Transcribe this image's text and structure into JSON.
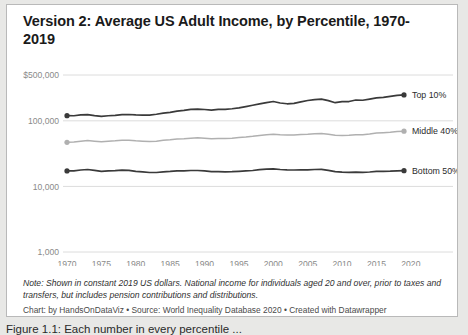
{
  "card": {
    "title": "Version 2: Average US Adult Income, by Percentile, 1970-2019",
    "note": "Note: Shown in constant 2019 US dollars. National income for individuals aged 20 and over, prior to taxes and transfers, but includes pension contributions and distributions.",
    "credit": "Chart: by HandsOnDataViz • Source: World Inequality Database 2020 • Created with Datawrapper"
  },
  "caption": {
    "text": "Figure 1.1: Each number in every percentile ..."
  },
  "colors": {
    "top": "#3a3a3a",
    "middle": "#b0b0b0",
    "bottom": "#3a3a3a",
    "grid": "#dcdcdc",
    "axis_text": "#8a8a8a",
    "border": "#b9b9b9",
    "page_background": "#e8e8e6",
    "card_background": "#ffffff"
  },
  "chart_data": {
    "type": "line",
    "title": "Version 2: Average US Adult Income, by Percentile, 1970-2019",
    "xlabel": "",
    "ylabel": "",
    "yscale": "log",
    "ylim": [
      1000,
      500000
    ],
    "xlim": [
      1970,
      2019
    ],
    "grid": true,
    "legend_position": "right-inline",
    "ytick_labels": [
      "$500,000",
      "100,000",
      "10,000",
      "1,000"
    ],
    "ytick_values": [
      500000,
      100000,
      10000,
      1000
    ],
    "xtick_labels": [
      "1970",
      "1975",
      "1980",
      "1985",
      "1990",
      "1995",
      "2000",
      "2005",
      "2010",
      "2015",
      "2020"
    ],
    "xtick_values": [
      1970,
      1975,
      1980,
      1985,
      1990,
      1995,
      2000,
      2005,
      2010,
      2015,
      2020
    ],
    "x": [
      1970,
      1971,
      1972,
      1973,
      1974,
      1975,
      1976,
      1977,
      1978,
      1979,
      1980,
      1981,
      1982,
      1983,
      1984,
      1985,
      1986,
      1987,
      1988,
      1989,
      1990,
      1991,
      1992,
      1993,
      1994,
      1995,
      1996,
      1997,
      1998,
      1999,
      2000,
      2001,
      2002,
      2003,
      2004,
      2005,
      2006,
      2007,
      2008,
      2009,
      2010,
      2011,
      2012,
      2013,
      2014,
      2015,
      2016,
      2017,
      2018,
      2019
    ],
    "series": [
      {
        "name": "Top 10%",
        "color": "#3a3a3a",
        "label": "Top 10%",
        "values": [
          120000,
          119500,
          123000,
          124000,
          120000,
          117000,
          119500,
          121000,
          124000,
          125000,
          123000,
          122000,
          122500,
          126000,
          131000,
          135000,
          141000,
          144000,
          150000,
          151000,
          149000,
          146000,
          150000,
          150000,
          153000,
          158000,
          165000,
          173000,
          181000,
          189000,
          197000,
          187000,
          182000,
          185000,
          195000,
          204000,
          211000,
          214000,
          203000,
          189000,
          196000,
          197000,
          208000,
          206000,
          215000,
          224000,
          228000,
          236000,
          244000,
          248000
        ]
      },
      {
        "name": "Middle 40%",
        "color": "#b0b0b0",
        "label": "Middle 40%",
        "values": [
          47000,
          47500,
          49000,
          50000,
          49000,
          48000,
          49000,
          49500,
          50500,
          50500,
          49500,
          49000,
          48500,
          49000,
          50500,
          51500,
          53000,
          53500,
          54500,
          55000,
          54500,
          53500,
          54000,
          54000,
          54500,
          55500,
          56500,
          58000,
          60000,
          61500,
          62500,
          61500,
          61000,
          61000,
          62000,
          62500,
          63500,
          64000,
          62500,
          60500,
          60000,
          60500,
          61500,
          61500,
          63000,
          65000,
          66000,
          67000,
          68500,
          69500
        ]
      },
      {
        "name": "Bottom 50%",
        "color": "#3a3a3a",
        "label": "Bottom 50%",
        "values": [
          17200,
          17300,
          17800,
          18100,
          17600,
          17000,
          17300,
          17400,
          17700,
          17600,
          17000,
          16700,
          16300,
          16300,
          16700,
          16900,
          17200,
          17300,
          17500,
          17500,
          17200,
          16800,
          16800,
          16700,
          16800,
          17000,
          17200,
          17500,
          18000,
          18300,
          18500,
          18100,
          17900,
          17800,
          17900,
          17900,
          18100,
          18200,
          17600,
          16800,
          16500,
          16400,
          16500,
          16400,
          16600,
          16900,
          17000,
          17100,
          17300,
          17400
        ]
      }
    ]
  }
}
